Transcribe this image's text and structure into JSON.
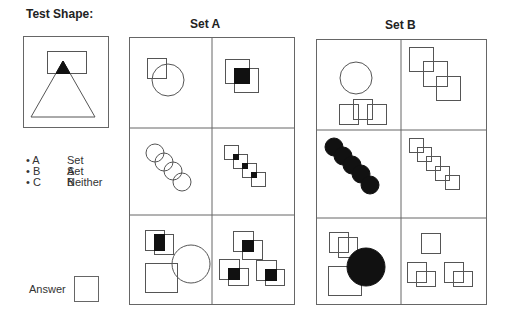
{
  "test_shape": {
    "title": "Test Shape:"
  },
  "options": [
    {
      "key": "A",
      "label": "Set A"
    },
    {
      "key": "B",
      "label": "Set B"
    },
    {
      "key": "C",
      "label": "Neither"
    }
  ],
  "answer": {
    "label": "Answer",
    "value": ""
  },
  "set_a": {
    "title": "Set A",
    "cells": 6
  },
  "set_b": {
    "title": "Set B",
    "cells": 6
  },
  "colors": {
    "stroke": "#555555",
    "fill": "#111111",
    "text": "#222222"
  }
}
